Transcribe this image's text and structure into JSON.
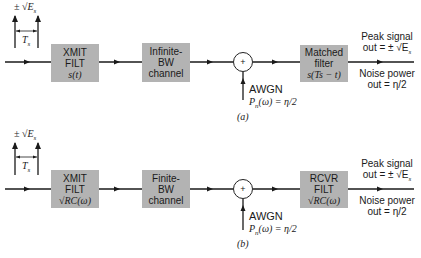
{
  "diagrams": [
    {
      "id": "a",
      "caption": "(a)",
      "input": {
        "amplitude": "± √E",
        "amplitude_sub": "s",
        "period": "T",
        "period_sub": "s"
      },
      "blocks": [
        {
          "line1": "XMIT",
          "line2": "FILT",
          "line3": "s(t)"
        },
        {
          "line1": "Infinite-",
          "line2": "BW",
          "line3": "channel"
        },
        {
          "line1": "Matched",
          "line2": "filter",
          "line3": "s(Ts − t)"
        }
      ],
      "summer": "+",
      "noise": {
        "label": "AWGN",
        "psd": "P",
        "psd_sub": "n",
        "psd_rest": "(ω) = η/2"
      },
      "output": {
        "signal_line1": "Peak signal",
        "signal_line2": "out = ± √E",
        "signal_sub": "s",
        "noise_line1": "Noise power",
        "noise_line2": "out = η/2"
      }
    },
    {
      "id": "b",
      "caption": "(b)",
      "input": {
        "amplitude": "± √E",
        "amplitude_sub": "s",
        "period": "T",
        "period_sub": "s"
      },
      "blocks": [
        {
          "line1": "XMIT",
          "line2": "FILT",
          "line3": "√RC(ω)"
        },
        {
          "line1": "Finite-",
          "line2": "BW",
          "line3": "channel"
        },
        {
          "line1": "RCVR",
          "line2": "FILT",
          "line3": "√RC(ω)"
        }
      ],
      "summer": "+",
      "noise": {
        "label": "AWGN",
        "psd": "P",
        "psd_sub": "n",
        "psd_rest": "(ω) = η/2"
      },
      "output": {
        "signal_line1": "Peak signal",
        "signal_line2": "out = ± √E",
        "signal_sub": "s",
        "noise_line1": "Noise power",
        "noise_line2": "out = η/2"
      }
    }
  ],
  "colors": {
    "block_fill": "#b3b3b3",
    "line": "#1a1a1a",
    "background": "#ffffff"
  }
}
